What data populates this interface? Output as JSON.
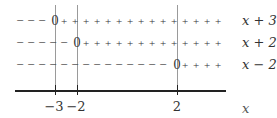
{
  "chart_data": {
    "type": "sign-chart",
    "variable": "x",
    "critical_points": [
      {
        "label": "−3",
        "value": -3
      },
      {
        "label": "−2",
        "value": -2
      },
      {
        "label": "2",
        "value": 2
      }
    ],
    "rows": [
      {
        "factor": "x + 3",
        "zero_at": -3,
        "left_sign": "−",
        "right_sign": "+"
      },
      {
        "factor": "x + 2",
        "zero_at": -2,
        "left_sign": "−",
        "right_sign": "+"
      },
      {
        "factor": "x − 2",
        "zero_at": 2,
        "left_sign": "−",
        "right_sign": "+"
      }
    ],
    "axis_label": "x"
  },
  "labels": {
    "row0_factor": "x + 3",
    "row1_factor": "x + 2",
    "row2_factor": "x − 2",
    "tick0": "−3",
    "tick1": "−2",
    "tick2": "2",
    "axis_var": "x"
  }
}
